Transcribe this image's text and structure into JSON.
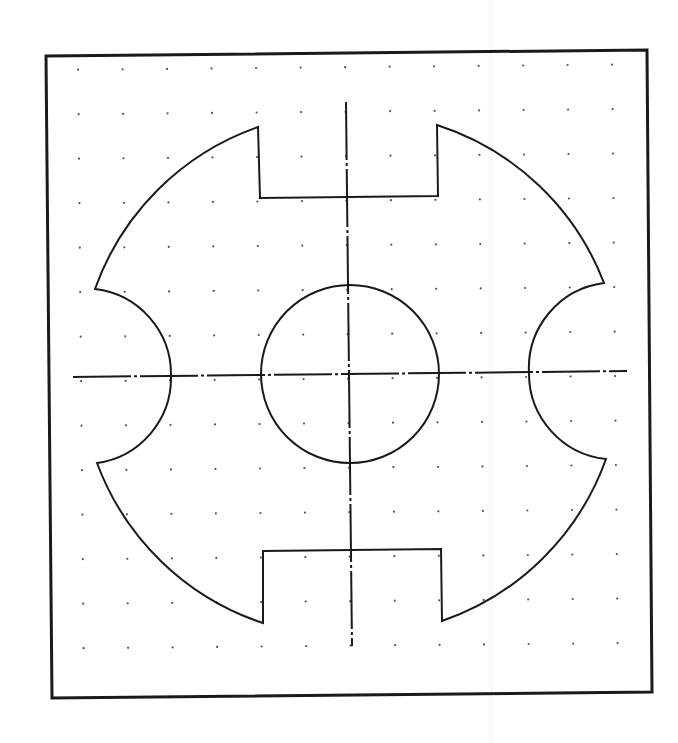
{
  "drawing": {
    "title": "Slotted disc with circular notches and center hole",
    "description": "CAD-style part drawing on a dot grid: circular disc with two rectangular slots (top and bottom), two concave circular notches (left and right), a central circular hole, and dash-dot center lines.",
    "colors": {
      "background": "#ffffff",
      "line": "#1a1a1a",
      "grid_dot": "#555555",
      "artifact": "#f0f0f0"
    },
    "frame": {
      "corners": [
        [
          46,
          56
        ],
        [
          647,
          50
        ],
        [
          652,
          692
        ],
        [
          52,
          698
        ]
      ],
      "stroke_width": 3
    },
    "grid": {
      "spacing": 44.5,
      "origin_x": 78,
      "origin_y": 70,
      "cols": 13,
      "rows": 14,
      "dot_radius": 1.1
    },
    "center": [
      349,
      374
    ],
    "outline": {
      "stroke_width": 2,
      "outer_radius": 266,
      "points": {
        "top_slot_left_top": [
          258,
          127
        ],
        "top_slot_left_bottom": [
          260,
          198
        ],
        "top_slot_right_bottom": [
          438,
          196
        ],
        "top_slot_right_top": [
          437,
          125
        ],
        "right_notch_top": [
          604,
          283
        ],
        "right_notch_inner": [
          529,
          373
        ],
        "right_notch_bottom": [
          606,
          459
        ],
        "bottom_slot_right_bottom": [
          442,
          621
        ],
        "bottom_slot_right_top": [
          441,
          549
        ],
        "bottom_slot_left_top": [
          263,
          551
        ],
        "bottom_slot_left_bottom": [
          263,
          623
        ],
        "left_notch_bottom": [
          97,
          463
        ],
        "left_notch_inner": [
          171,
          376
        ],
        "left_notch_top": [
          95,
          289
        ]
      },
      "notch_radius": 86
    },
    "hole": {
      "cx": 350,
      "cy": 374,
      "r": 89,
      "stroke_width": 2
    },
    "centerlines": {
      "horizontal": {
        "x1": 73,
        "y1": 377,
        "x2": 627,
        "y2": 371
      },
      "vertical": {
        "x1": 346,
        "y1": 102,
        "x2": 352,
        "y2": 646
      },
      "stroke_width": 2,
      "dash": "58 3 3 3"
    },
    "artifacts": [
      {
        "x": 491
      }
    ]
  }
}
